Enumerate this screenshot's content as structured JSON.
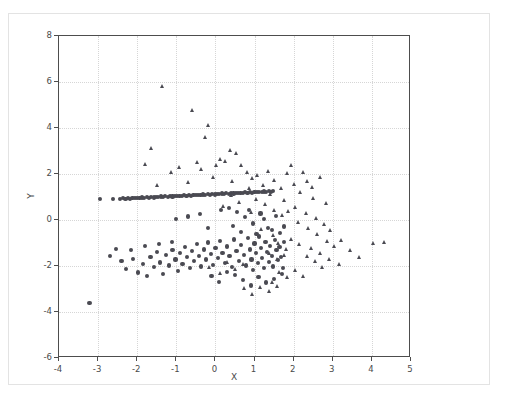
{
  "chart_data": {
    "type": "scatter",
    "title": "",
    "xlabel": "X",
    "ylabel": "Y",
    "xlim": [
      -4,
      5
    ],
    "ylim": [
      -6,
      8
    ],
    "xticks": [
      -4,
      -3,
      -2,
      -1,
      0,
      1,
      2,
      3,
      4,
      5
    ],
    "yticks": [
      -6,
      -4,
      -2,
      0,
      2,
      4,
      6,
      8
    ],
    "xticklabels": [
      "-4",
      "-3",
      "-2",
      "-1",
      "0",
      "1",
      "2",
      "3",
      "4",
      "5"
    ],
    "yticklabels": [
      "-6",
      "-4",
      "-2",
      "0",
      "2",
      "4",
      "6",
      "8"
    ],
    "grid": true,
    "legend": null,
    "marker_color": "#4a4a52",
    "series": [
      {
        "name": "circles",
        "marker": "o",
        "color": "#4a4a52",
        "points": [
          [
            -3.22,
            -3.62
          ],
          [
            -2.96,
            0.92
          ],
          [
            -2.62,
            0.9
          ],
          [
            -2.44,
            0.92
          ],
          [
            -2.36,
            0.94
          ],
          [
            -2.3,
            0.93
          ],
          [
            -2.24,
            0.95
          ],
          [
            -2.18,
            0.93
          ],
          [
            -2.12,
            0.96
          ],
          [
            -2.06,
            0.94
          ],
          [
            -2.0,
            0.97
          ],
          [
            -1.94,
            0.95
          ],
          [
            -1.88,
            0.98
          ],
          [
            -1.82,
            0.96
          ],
          [
            -1.76,
            0.99
          ],
          [
            -1.7,
            0.97
          ],
          [
            -1.64,
            1.0
          ],
          [
            -1.58,
            0.98
          ],
          [
            -1.52,
            1.01
          ],
          [
            -1.46,
            0.99
          ],
          [
            -1.4,
            1.02
          ],
          [
            -1.34,
            1.0
          ],
          [
            -1.28,
            1.03
          ],
          [
            -1.22,
            1.01
          ],
          [
            -1.16,
            1.04
          ],
          [
            -1.1,
            1.02
          ],
          [
            -1.04,
            1.05
          ],
          [
            -0.98,
            1.03
          ],
          [
            -0.92,
            1.06
          ],
          [
            -0.86,
            1.04
          ],
          [
            -0.8,
            1.07
          ],
          [
            -0.74,
            1.05
          ],
          [
            -0.68,
            1.08
          ],
          [
            -0.62,
            1.06
          ],
          [
            -0.56,
            1.09
          ],
          [
            -0.5,
            1.07
          ],
          [
            -0.44,
            1.1
          ],
          [
            -0.38,
            1.08
          ],
          [
            -0.32,
            1.11
          ],
          [
            -0.26,
            1.09
          ],
          [
            -0.2,
            1.12
          ],
          [
            -0.14,
            1.1
          ],
          [
            -0.08,
            1.13
          ],
          [
            -0.02,
            1.11
          ],
          [
            0.04,
            1.14
          ],
          [
            0.1,
            1.12
          ],
          [
            0.16,
            1.15
          ],
          [
            0.22,
            1.13
          ],
          [
            0.28,
            1.16
          ],
          [
            0.34,
            1.14
          ],
          [
            0.4,
            1.17
          ],
          [
            0.46,
            1.15
          ],
          [
            0.52,
            1.18
          ],
          [
            0.58,
            1.16
          ],
          [
            0.64,
            1.19
          ],
          [
            0.7,
            1.17
          ],
          [
            0.76,
            1.2
          ],
          [
            0.82,
            1.18
          ],
          [
            0.88,
            1.21
          ],
          [
            0.94,
            1.19
          ],
          [
            1.0,
            1.22
          ],
          [
            1.06,
            1.2
          ],
          [
            1.12,
            1.23
          ],
          [
            1.18,
            1.21
          ],
          [
            1.24,
            1.24
          ],
          [
            1.3,
            1.22
          ],
          [
            1.36,
            1.25
          ],
          [
            1.42,
            1.23
          ],
          [
            1.48,
            1.26
          ],
          [
            -2.7,
            -1.55
          ],
          [
            -2.4,
            -1.78
          ],
          [
            -2.28,
            -2.12
          ],
          [
            -2.1,
            -1.68
          ],
          [
            -1.98,
            -2.28
          ],
          [
            -1.86,
            -1.92
          ],
          [
            -1.74,
            -2.42
          ],
          [
            -1.66,
            -1.6
          ],
          [
            -1.58,
            -2.05
          ],
          [
            -1.5,
            -1.4
          ],
          [
            -1.42,
            -1.85
          ],
          [
            -1.34,
            -2.35
          ],
          [
            -1.26,
            -1.52
          ],
          [
            -1.18,
            -1.98
          ],
          [
            -1.1,
            -1.3
          ],
          [
            -1.02,
            -1.72
          ],
          [
            -0.96,
            -2.2
          ],
          [
            -0.9,
            -1.45
          ],
          [
            -0.84,
            -1.9
          ],
          [
            -0.78,
            -1.18
          ],
          [
            -0.72,
            -1.62
          ],
          [
            -0.66,
            -2.08
          ],
          [
            -0.6,
            -1.35
          ],
          [
            -0.54,
            -1.8
          ],
          [
            -0.48,
            -1.05
          ],
          [
            -0.42,
            -1.55
          ],
          [
            -0.36,
            -2.02
          ],
          [
            -0.3,
            -1.28
          ],
          [
            -0.24,
            -1.72
          ],
          [
            -0.18,
            -0.98
          ],
          [
            -0.12,
            -1.48
          ],
          [
            -0.06,
            -1.95
          ],
          [
            0.0,
            -1.22
          ],
          [
            0.06,
            -1.65
          ],
          [
            0.12,
            -0.92
          ],
          [
            0.18,
            -1.42
          ],
          [
            0.24,
            -1.88
          ],
          [
            0.3,
            -1.15
          ],
          [
            0.36,
            -1.58
          ],
          [
            0.42,
            -2.05
          ],
          [
            0.48,
            -0.85
          ],
          [
            0.54,
            -1.35
          ],
          [
            0.6,
            -1.8
          ],
          [
            0.66,
            -1.08
          ],
          [
            0.72,
            -1.52
          ],
          [
            0.78,
            -1.98
          ],
          [
            0.84,
            -0.78
          ],
          [
            0.88,
            -1.28
          ],
          [
            0.92,
            -1.72
          ],
          [
            0.96,
            -2.18
          ],
          [
            1.0,
            -1.02
          ],
          [
            1.04,
            -1.45
          ],
          [
            1.08,
            -1.88
          ],
          [
            1.12,
            -0.72
          ],
          [
            1.16,
            -1.22
          ],
          [
            1.2,
            -1.65
          ],
          [
            1.24,
            -2.1
          ],
          [
            1.28,
            -0.95
          ],
          [
            1.32,
            -1.38
          ],
          [
            1.36,
            -1.82
          ],
          [
            1.4,
            -1.12
          ],
          [
            1.44,
            -1.58
          ],
          [
            1.48,
            -2.02
          ],
          [
            1.52,
            -0.88
          ],
          [
            1.56,
            -1.32
          ],
          [
            1.6,
            -1.75
          ],
          [
            1.64,
            -1.18
          ],
          [
            1.68,
            -1.62
          ],
          [
            1.72,
            -2.08
          ],
          [
            1.76,
            -0.95
          ],
          [
            0.7,
            -2.62
          ],
          [
            0.9,
            -2.85
          ],
          [
            1.1,
            -2.48
          ],
          [
            1.3,
            -2.72
          ],
          [
            0.5,
            -2.38
          ],
          [
            1.5,
            -2.55
          ],
          [
            0.3,
            -2.25
          ],
          [
            1.7,
            -2.35
          ],
          [
            -0.1,
            -2.45
          ],
          [
            0.1,
            -2.68
          ],
          [
            -2.55,
            -1.25
          ],
          [
            -2.15,
            -1.32
          ],
          [
            -1.8,
            -1.12
          ],
          [
            -1.45,
            -1.05
          ],
          [
            -1.12,
            -0.95
          ],
          [
            0.55,
            0.35
          ],
          [
            0.75,
            0.12
          ],
          [
            0.95,
            -0.15
          ],
          [
            1.15,
            0.28
          ],
          [
            1.35,
            -0.35
          ],
          [
            0.65,
            -0.52
          ],
          [
            0.85,
            0.45
          ],
          [
            1.05,
            -0.62
          ],
          [
            1.25,
            0.05
          ],
          [
            1.45,
            -0.42
          ],
          [
            0.45,
            -0.25
          ],
          [
            1.55,
            0.18
          ],
          [
            1.65,
            -0.55
          ],
          [
            0.35,
            0.52
          ],
          [
            1.75,
            -0.28
          ],
          [
            -0.4,
            0.25
          ],
          [
            -0.7,
            0.15
          ],
          [
            -1.0,
            0.05
          ],
          [
            0.15,
            0.42
          ],
          [
            -0.2,
            -0.35
          ]
        ]
      },
      {
        "name": "triangles",
        "marker": "^",
        "color": "#4a4a52",
        "points": [
          [
            -1.35,
            5.8
          ],
          [
            -0.58,
            4.75
          ],
          [
            -0.18,
            4.12
          ],
          [
            -0.25,
            3.58
          ],
          [
            -1.62,
            3.12
          ],
          [
            -1.78,
            2.42
          ],
          [
            0.38,
            3.02
          ],
          [
            0.55,
            2.88
          ],
          [
            0.12,
            2.62
          ],
          [
            -0.45,
            2.48
          ],
          [
            -1.12,
            2.05
          ],
          [
            -1.48,
            1.48
          ],
          [
            0.68,
            2.38
          ],
          [
            0.82,
            2.05
          ],
          [
            0.95,
            1.82
          ],
          [
            1.08,
            1.95
          ],
          [
            1.22,
            1.48
          ],
          [
            1.35,
            2.12
          ],
          [
            1.52,
            1.72
          ],
          [
            1.68,
            1.38
          ],
          [
            1.85,
            2.02
          ],
          [
            2.02,
            1.55
          ],
          [
            2.18,
            1.18
          ],
          [
            2.35,
            1.68
          ],
          [
            2.52,
            0.95
          ],
          [
            -0.92,
            2.28
          ],
          [
            -0.35,
            2.18
          ],
          [
            0.02,
            2.35
          ],
          [
            0.25,
            2.55
          ],
          [
            -0.68,
            1.62
          ],
          [
            1.95,
            2.35
          ],
          [
            2.25,
            2.05
          ],
          [
            2.48,
            1.42
          ],
          [
            2.68,
            1.85
          ],
          [
            2.85,
            0.72
          ],
          [
            -0.05,
            1.85
          ],
          [
            0.45,
            1.65
          ],
          [
            0.88,
            1.35
          ],
          [
            1.42,
            1.12
          ],
          [
            1.78,
            0.85
          ],
          [
            2.05,
            0.52
          ],
          [
            2.32,
            0.28
          ],
          [
            2.58,
            0.05
          ],
          [
            2.78,
            -0.22
          ],
          [
            2.95,
            -0.48
          ],
          [
            1.88,
            0.35
          ],
          [
            2.12,
            -0.12
          ],
          [
            2.38,
            -0.38
          ],
          [
            2.62,
            -0.65
          ],
          [
            2.88,
            -0.92
          ],
          [
            3.05,
            -1.15
          ],
          [
            3.22,
            -0.88
          ],
          [
            2.45,
            -1.25
          ],
          [
            2.68,
            -1.48
          ],
          [
            2.92,
            -1.72
          ],
          [
            1.95,
            -0.85
          ],
          [
            2.15,
            -1.08
          ],
          [
            2.35,
            -1.58
          ],
          [
            2.55,
            -1.82
          ],
          [
            2.75,
            -2.05
          ],
          [
            1.65,
            -2.28
          ],
          [
            1.85,
            -2.52
          ],
          [
            2.05,
            -2.18
          ],
          [
            2.25,
            -2.45
          ],
          [
            1.45,
            -2.72
          ],
          [
            4.05,
            -1.02
          ],
          [
            4.32,
            -0.98
          ],
          [
            3.45,
            -1.35
          ],
          [
            3.68,
            -1.62
          ],
          [
            3.18,
            -1.92
          ],
          [
            1.15,
            -2.95
          ],
          [
            1.38,
            -3.12
          ],
          [
            0.95,
            -3.25
          ],
          [
            1.58,
            -2.88
          ],
          [
            0.75,
            -2.98
          ],
          [
            1.05,
            0.88
          ],
          [
            1.28,
            0.65
          ],
          [
            1.52,
            0.42
          ],
          [
            1.72,
            0.18
          ],
          [
            0.92,
            0.32
          ],
          [
            0.62,
            0.75
          ],
          [
            0.42,
            1.05
          ],
          [
            0.22,
            0.58
          ],
          [
            1.18,
            -0.42
          ],
          [
            1.48,
            -0.68
          ],
          [
            0.72,
            -1.95
          ],
          [
            0.52,
            -2.15
          ],
          [
            0.32,
            -1.85
          ],
          [
            0.12,
            -2.35
          ],
          [
            -0.15,
            -2.08
          ],
          [
            1.62,
            -1.02
          ],
          [
            1.82,
            -1.28
          ],
          [
            1.38,
            -1.48
          ],
          [
            1.58,
            -1.72
          ],
          [
            1.78,
            -1.55
          ]
        ]
      }
    ]
  }
}
